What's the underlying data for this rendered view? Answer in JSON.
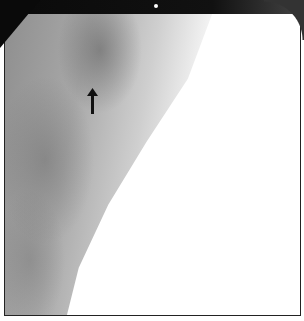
{
  "image": {
    "type": "grayscale radiograph (mammogram-like)",
    "annotation": {
      "icon": "arrow-up-icon",
      "position": {
        "x": 92,
        "y": 100
      }
    },
    "marker_dot": {
      "x": 156,
      "y": 6
    },
    "colors": {
      "frame": "#222222",
      "background": "#ffffff",
      "tissue": "#9a9a9a",
      "arrow": "#111111"
    }
  }
}
